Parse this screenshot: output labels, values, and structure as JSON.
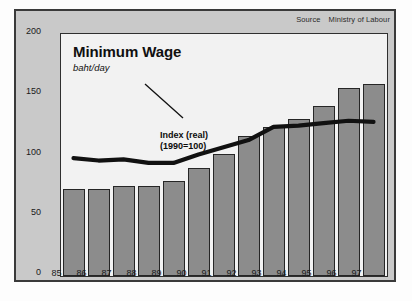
{
  "chart_data": {
    "type": "bar",
    "title": "Minimum Wage",
    "subtitle": "baht/day",
    "xlabel": "",
    "ylabel": "baht/day",
    "ylim": [
      0,
      200
    ],
    "yticks": [
      "0",
      "50",
      "100",
      "150",
      "200"
    ],
    "ytick_values": [
      0,
      50,
      100,
      150,
      200
    ],
    "grid": false,
    "legend_position": "none",
    "categories": [
      "85",
      "86",
      "87",
      "88",
      "89",
      "90",
      "91",
      "92",
      "93",
      "94",
      "95",
      "96",
      "97"
    ],
    "series": [
      {
        "name": "Minimum Wage (baht/day)",
        "type": "bar",
        "values": [
          72,
          72,
          75,
          75,
          79,
          90,
          101,
          116,
          124,
          130,
          141,
          156,
          159
        ]
      },
      {
        "name": "Index (real) (1990=100)",
        "type": "line",
        "values": [
          97,
          95,
          96,
          93,
          93,
          100,
          106,
          112,
          123,
          124,
          126,
          128,
          127
        ]
      }
    ],
    "annotations": [
      {
        "name": "index-line-annotation",
        "line1": "Index (real)",
        "line2": "(1990=100)"
      }
    ],
    "source": {
      "label": "Source",
      "value": "Ministry of Labour"
    },
    "colors": {
      "bar_fill": "#8c8c8c",
      "bar_stroke": "#262626",
      "line": "#111111",
      "panel_bg": "#c9c9c9",
      "plot_bg": "#f2f2f2",
      "frame": "#3a3a3a",
      "text": "#101010"
    }
  }
}
